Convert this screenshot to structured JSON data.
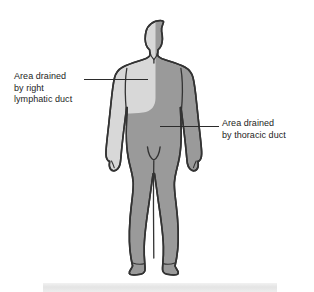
{
  "diagram": {
    "figure": {
      "name": "human-body-front-view",
      "orientation": "anterior"
    },
    "regions": [
      {
        "id": "right-lymphatic-duct",
        "label_lines": [
          "Area drained",
          "by right",
          "lymphatic duct"
        ],
        "color": "#d8d8d8",
        "covers": "left side of head, left arm, left upper torso (viewer's left)"
      },
      {
        "id": "thoracic-duct",
        "label_lines": [
          "Area drained",
          "by thoracic duct"
        ],
        "color": "#9a9a9a",
        "covers": "remainder of body: right head, right arm, lower torso, both legs"
      }
    ],
    "labels": {
      "right_lymphatic": {
        "line1": "Area drained",
        "line2": "by right",
        "line3": "lymphatic duct"
      },
      "thoracic": {
        "line1": "Area drained",
        "line2": "by thoracic duct"
      }
    },
    "colors": {
      "outline": "#333333",
      "light_region": "#d8d8d8",
      "dark_region": "#9a9a9a",
      "leader_line": "#2b2b2b",
      "text": "#1d1d1d",
      "background": "#ffffff",
      "caption_bar": "#e8e8e8"
    }
  }
}
